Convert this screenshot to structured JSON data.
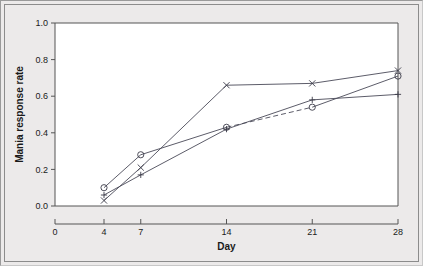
{
  "chart_data": {
    "type": "line",
    "title": "",
    "xlabel": "Day",
    "ylabel": "Mania response rate",
    "x": [
      4,
      7,
      14,
      21,
      28
    ],
    "xticks": [
      0,
      4,
      7,
      14,
      21,
      28
    ],
    "xticklabels": [
      "0",
      "4",
      "7",
      "14",
      "21",
      "28"
    ],
    "yticks": [
      0.0,
      0.2,
      0.4,
      0.6,
      0.8,
      1.0
    ],
    "yticklabels": [
      "0.0",
      "0.2",
      "0.4",
      "0.6",
      "0.8",
      "1.0"
    ],
    "xlim": [
      0,
      28
    ],
    "ylim": [
      0.0,
      1.0
    ],
    "grid": false,
    "legend": "none",
    "series": [
      {
        "name": "circle-series",
        "marker": "circle",
        "linestyle": "dashed-partial",
        "values": [
          0.1,
          0.28,
          0.43,
          0.54,
          0.71
        ]
      },
      {
        "name": "plus-series",
        "marker": "plus",
        "linestyle": "solid",
        "values": [
          0.06,
          0.17,
          0.42,
          0.58,
          0.61
        ]
      },
      {
        "name": "cross-series",
        "marker": "cross",
        "linestyle": "solid",
        "values": [
          0.03,
          0.21,
          0.66,
          0.67,
          0.74
        ]
      }
    ]
  },
  "colors": {
    "figure_background": "#eceaea",
    "plot_background": "#ffffff",
    "axis": "#555555",
    "line": "#4a4a58",
    "text": "#1a1a1a"
  }
}
